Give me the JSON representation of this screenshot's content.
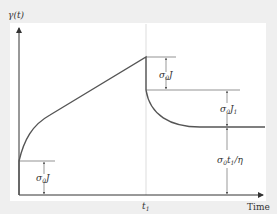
{
  "diagram": {
    "y_axis_label": "γ(t)",
    "x_axis_label": "Time",
    "tick_label": "t",
    "tick_label_sub": "1",
    "annotations": {
      "elastic_jump_top": {
        "sigma": "σ",
        "sub0": "0",
        "rest": "J"
      },
      "delayed_recovery": {
        "sigma": "σ",
        "sub0": "0",
        "rest": "J",
        "sub1": "1"
      },
      "permanent_flow": {
        "sigma": "σ",
        "sub0": "0",
        "t": "t",
        "sub1": "1",
        "rest": "/η"
      },
      "elastic_jump_bottom": {
        "sigma": "σ",
        "sub0": "0",
        "rest": "J"
      }
    },
    "colors": {
      "curve": "#555555",
      "axis": "#333333",
      "guide": "#666666",
      "t1_line": "#dddddd",
      "background": "#efefef",
      "panel": "#ffffff"
    }
  }
}
